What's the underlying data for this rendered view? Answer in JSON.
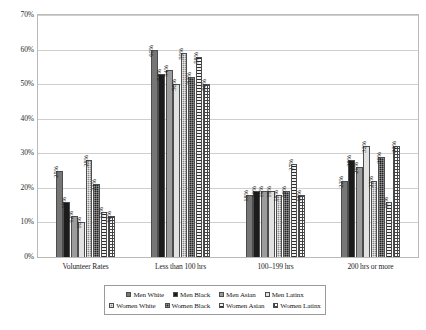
{
  "chart_data": {
    "type": "bar",
    "title": "",
    "xlabel": "",
    "ylabel": "",
    "ylim": [
      0,
      70
    ],
    "ytick_labels": [
      "70%",
      "60%",
      "50%",
      "40%",
      "30%",
      "20%",
      "10%",
      "0%"
    ],
    "ytick_values": [
      70,
      60,
      50,
      40,
      30,
      20,
      10,
      0
    ],
    "grid": true,
    "legend_position": "bottom",
    "value_suffix": "%",
    "categories": [
      "Volunteer Rates",
      "Less than 100 hrs",
      "100–199 hrs",
      "200 hrs or more"
    ],
    "series": [
      {
        "name": "Men White",
        "fill": "f-men-white",
        "values": [
          25,
          60,
          18,
          22
        ],
        "labels": [
          "25%",
          "60%",
          "18%",
          "22%"
        ]
      },
      {
        "name": "Men Black",
        "fill": "f-men-black",
        "values": [
          16,
          53,
          19,
          28
        ],
        "labels": [
          "16%",
          "53%",
          "19%",
          "28%"
        ]
      },
      {
        "name": "Men Asian",
        "fill": "f-men-asian",
        "values": [
          12,
          54,
          19,
          26
        ],
        "labels": [
          "12%",
          "54%",
          "19%",
          "26%"
        ]
      },
      {
        "name": "Men Latinx",
        "fill": "f-men-latinx",
        "values": [
          10,
          50,
          19,
          32
        ],
        "labels": [
          "10%",
          "50%",
          "19%",
          "32%"
        ]
      },
      {
        "name": "Women White",
        "fill": "f-women-white",
        "values": [
          28,
          59,
          18,
          22
        ],
        "labels": [
          "28%",
          "59%",
          "18%",
          "22%"
        ]
      },
      {
        "name": "Women Black",
        "fill": "f-women-black",
        "values": [
          21,
          52,
          19,
          29
        ],
        "labels": [
          "21%",
          "52%",
          "19%",
          "29%"
        ]
      },
      {
        "name": "Women Asian",
        "fill": "f-women-asian",
        "values": [
          13,
          58,
          27,
          16
        ],
        "labels": [
          "13%",
          "58%",
          "27%",
          "16%"
        ]
      },
      {
        "name": "Women Latinx",
        "fill": "f-women-latinx",
        "values": [
          12,
          50,
          18,
          32
        ],
        "labels": [
          "12%",
          "50%",
          "18%",
          "32%"
        ]
      }
    ]
  },
  "legend": {
    "rows": [
      [
        "Men White",
        "Men Black",
        "Men Asian",
        "Men Latinx"
      ],
      [
        "Women White",
        "Women Black",
        "Women Asian",
        "Women Latinx"
      ]
    ]
  }
}
